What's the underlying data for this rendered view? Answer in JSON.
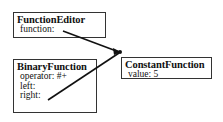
{
  "diagram": {
    "nodes": [
      {
        "id": "function-editor",
        "title": "FunctionEditor",
        "fields": [
          "function:"
        ]
      },
      {
        "id": "binary-function",
        "title": "BinaryFunction",
        "fields": [
          "operator: #+",
          "left:",
          "right:"
        ]
      },
      {
        "id": "constant-function",
        "title": "ConstantFunction",
        "fields": [
          "value: 5"
        ]
      }
    ],
    "edges": [
      {
        "from": "function-editor.function",
        "to": "constant-function"
      },
      {
        "from": "binary-function.right",
        "to": "constant-function"
      }
    ],
    "colors": {
      "line": "#111111",
      "border": "#333333",
      "background": "#ffffff"
    }
  }
}
